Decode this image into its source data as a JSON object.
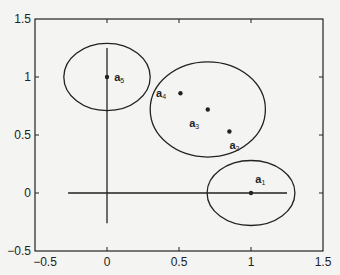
{
  "chart_data": {
    "type": "scatter",
    "title": "",
    "xlabel": "",
    "ylabel": "",
    "xlim": [
      -0.5,
      1.5
    ],
    "ylim": [
      -0.5,
      1.5
    ],
    "grid": false,
    "legend": null,
    "x_ticks": [
      -0.5,
      0,
      0.5,
      1,
      1.5
    ],
    "y_ticks": [
      -0.5,
      0,
      0.5,
      1,
      1.5
    ],
    "x_tick_labels": [
      "-0.5",
      "0",
      "0.5",
      "1",
      "1.5"
    ],
    "y_tick_labels": [
      "-0.5",
      "0",
      "0.5",
      "1",
      "1.5"
    ],
    "points": [
      {
        "name": "a",
        "sub": "1",
        "x": 1.0,
        "y": 0.0,
        "label_dx": 0.03,
        "label_dy": 0.12
      },
      {
        "name": "a",
        "sub": "2",
        "x": 0.85,
        "y": 0.53,
        "label_dx": 0.0,
        "label_dy": -0.12
      },
      {
        "name": "a",
        "sub": "3",
        "x": 0.7,
        "y": 0.72,
        "label_dx": -0.06,
        "label_dy": -0.12
      },
      {
        "name": "a",
        "sub": "4",
        "x": 0.51,
        "y": 0.86,
        "label_dx": -0.1,
        "label_dy": 0.0
      },
      {
        "name": "a",
        "sub": "5",
        "x": 0.0,
        "y": 1.0,
        "label_dx": 0.05,
        "label_dy": 0.0
      }
    ],
    "ellipses": [
      {
        "name": "cluster-a5",
        "cx": 0.0,
        "cy": 1.0,
        "rx": 0.3,
        "ry": 0.29
      },
      {
        "name": "cluster-a2-a4",
        "cx": 0.7,
        "cy": 0.72,
        "rx": 0.4,
        "ry": 0.41
      },
      {
        "name": "cluster-a1",
        "cx": 1.0,
        "cy": 0.0,
        "rx": 0.305,
        "ry": 0.28
      }
    ],
    "lines": [
      {
        "name": "horizontal-axis-line",
        "x1": -0.27,
        "y1": 0.0,
        "x2": 1.25,
        "y2": 0.0
      },
      {
        "name": "vertical-axis-line",
        "x1": 0.0,
        "y1": -0.26,
        "x2": 0.0,
        "y2": 1.25
      }
    ]
  },
  "colors": {
    "background": "#f4f4f2",
    "ink": "#222222"
  }
}
